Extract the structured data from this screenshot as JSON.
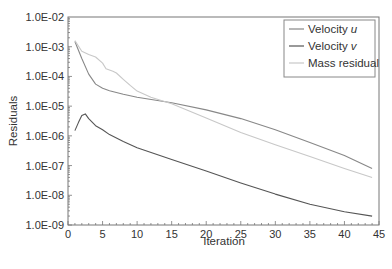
{
  "chart_data": {
    "type": "line",
    "title": "",
    "xlabel": "Iteration",
    "ylabel": "Residuals",
    "xlim": [
      0,
      45
    ],
    "ylim": [
      1e-09,
      0.01
    ],
    "yscale": "log",
    "grid": false,
    "legend_position": "upper right",
    "x_ticks": [
      0,
      5,
      10,
      15,
      20,
      25,
      30,
      35,
      40,
      45
    ],
    "x_tick_labels": [
      "0",
      "5",
      "10",
      "15",
      "20",
      "25",
      "30",
      "35",
      "40",
      "45"
    ],
    "y_ticks": [
      0.01,
      0.001,
      0.0001,
      1e-05,
      1e-06,
      1e-07,
      1e-08,
      1e-09
    ],
    "y_tick_labels": [
      "1.0E-02",
      "1.0E-03",
      "1.0E-04",
      "1.0E-05",
      "1.0E-06",
      "1.0E-07",
      "1.0E-08",
      "1.0E-09"
    ],
    "series": [
      {
        "name": "Velocity u",
        "legend_main": "Velocity ",
        "legend_italic": "u",
        "color": "#888888",
        "x": [
          1,
          2,
          3,
          4,
          5,
          6,
          8,
          10,
          15,
          20,
          25,
          30,
          35,
          40,
          44
        ],
        "values": [
          0.0015,
          0.0004,
          0.00012,
          5.5e-05,
          4e-05,
          3.3e-05,
          2.5e-05,
          2e-05,
          1.3e-05,
          7.5e-06,
          3.8e-06,
          1.6e-06,
          6e-07,
          2.2e-07,
          8e-08
        ]
      },
      {
        "name": "Velocity v",
        "legend_main": "Velocity ",
        "legend_italic": "v",
        "color": "#555555",
        "x": [
          1,
          1.5,
          2,
          2.5,
          3,
          4,
          5,
          6,
          8,
          10,
          15,
          20,
          25,
          30,
          35,
          40,
          44
        ],
        "values": [
          1.5e-06,
          2.8e-06,
          4.8e-06,
          5.5e-06,
          3.8e-06,
          2.2e-06,
          1.6e-06,
          1.1e-06,
          6.5e-07,
          4e-07,
          1.6e-07,
          6.5e-08,
          2.6e-08,
          1.1e-08,
          5e-09,
          2.8e-09,
          2e-09
        ]
      },
      {
        "name": "Mass residual",
        "legend_main": "Mass residual",
        "legend_italic": "",
        "color": "#c8c8c8",
        "x": [
          1,
          2,
          3,
          4,
          5,
          5.5,
          6.5,
          7,
          8,
          9,
          10,
          12,
          15,
          20,
          25,
          30,
          35,
          40,
          44
        ],
        "values": [
          0.0016,
          0.0007,
          0.00055,
          0.00045,
          0.00028,
          0.00018,
          0.00015,
          0.00013,
          8e-05,
          5e-05,
          3.2e-05,
          2e-05,
          1.2e-05,
          4e-06,
          1.3e-06,
          5e-07,
          2e-07,
          8e-08,
          4e-08
        ]
      }
    ]
  }
}
